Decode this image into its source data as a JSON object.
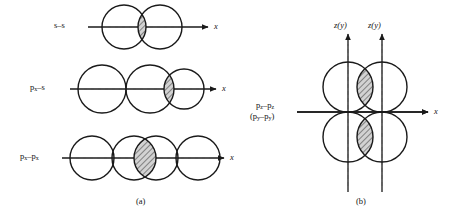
{
  "figure": {
    "title_a": "(a)",
    "title_b": "(b)",
    "panel_a": {
      "rows": [
        {
          "id": "s-s",
          "label_html": "s–s",
          "label_plain": "s-s",
          "axis_label": "x",
          "orbital_count": 2,
          "overlap_type": "sigma",
          "overlap_shading": "hatched-lens",
          "axis_y": 27,
          "axis_x_start": 88,
          "axis_x_end": 212,
          "circles": [
            {
              "cx": 124,
              "cy": 27,
              "r": 22
            },
            {
              "cx": 160,
              "cy": 27,
              "r": 22
            }
          ]
        },
        {
          "id": "px-s",
          "label_html": "p<sub>x</sub>–s",
          "label_plain": "px-s",
          "axis_label": "x",
          "orbital_count": 3,
          "overlap_type": "sigma",
          "overlap_shading": "hatched-lens",
          "axis_y": 89,
          "axis_x_start": 70,
          "axis_x_end": 220,
          "circles": [
            {
              "cx": 102,
              "cy": 89,
              "r": 24
            },
            {
              "cx": 150,
              "cy": 89,
              "r": 24
            },
            {
              "cx": 184,
              "cy": 89,
              "r": 20
            }
          ]
        },
        {
          "id": "px-px",
          "label_html": "p<sub>x</sub>–p<sub>x</sub>",
          "label_plain": "px-px",
          "axis_label": "x",
          "orbital_count": 4,
          "overlap_type": "sigma",
          "overlap_shading": "hatched-lens",
          "axis_y": 158,
          "axis_x_start": 62,
          "axis_x_end": 228,
          "circles": [
            {
              "cx": 92,
              "cy": 158,
              "r": 22
            },
            {
              "cx": 134,
              "cy": 158,
              "r": 22
            },
            {
              "cx": 156,
              "cy": 158,
              "r": 22
            },
            {
              "cx": 198,
              "cy": 158,
              "r": 22
            }
          ]
        }
      ]
    },
    "panel_b": {
      "label_line1_html": "p<sub>z</sub>–p<sub>z</sub>",
      "label_line1_plain": "pz-pz",
      "label_line2_html": "(p<sub>y</sub>–p<sub>y</sub>)",
      "label_line2_plain": "(py-py)",
      "axis_label_x": "x",
      "vertical_axis_labels": [
        "z(y)",
        "z(y)"
      ],
      "overlap_type": "pi",
      "overlap_shading": "hatched-lens",
      "horizontal_axis_y": 112,
      "horizontal_axis_x_start": 297,
      "horizontal_axis_x_end": 432,
      "vertical_axes_x": [
        348,
        382
      ],
      "circles": [
        {
          "cx": 348,
          "cy": 87,
          "r": 25,
          "position": "upper-left"
        },
        {
          "cx": 382,
          "cy": 87,
          "r": 25,
          "position": "upper-right"
        },
        {
          "cx": 348,
          "cy": 137,
          "r": 25,
          "position": "lower-left"
        },
        {
          "cx": 382,
          "cy": 137,
          "r": 25,
          "position": "lower-right"
        }
      ]
    },
    "colors": {
      "stroke": "#1a1a1a",
      "hatch": "#4a4a4a",
      "hatch_fill": "#cfcfcf",
      "background": "#ffffff",
      "dashed_axis": "#555555"
    }
  }
}
